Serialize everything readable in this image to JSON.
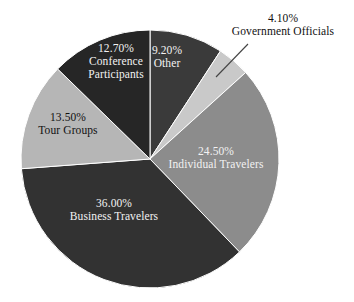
{
  "chart_data": {
    "type": "pie",
    "title": "",
    "subtitle": "",
    "xlabel": "",
    "ylabel": "",
    "legend_position": "none",
    "grid": false,
    "labels_inside": true,
    "categories": [
      "Other",
      "Government Officials",
      "Individual Travelers",
      "Business Travelers",
      "Tour Groups",
      "Conference Participants"
    ],
    "values": [
      9.2,
      4.1,
      24.5,
      36.0,
      13.5,
      12.7
    ],
    "value_labels": [
      "9.20%",
      "4.10%",
      "24.50%",
      "36.00%",
      "13.50%",
      "12.70%"
    ],
    "colors": [
      "#3a3a3a",
      "#c9c9c9",
      "#8c8c8c",
      "#323232",
      "#b6b6b6",
      "#262626"
    ],
    "start_angle_deg": 0,
    "direction": "clockwise",
    "units": "percent",
    "total": 100.0,
    "slices": [
      {
        "name": "Other",
        "value": 9.2,
        "pct_text": "9.20%",
        "name_text": "Other",
        "color": "#3a3a3a",
        "label_color": "#f2f2f2",
        "label_placement": "inside"
      },
      {
        "name": "Government Officials",
        "value": 4.1,
        "pct_text": "4.10%",
        "name_text": "Government Officials",
        "color": "#c9c9c9",
        "label_color": "#111111",
        "label_placement": "outside-with-leader"
      },
      {
        "name": "Individual Travelers",
        "value": 24.5,
        "pct_text": "24.50%",
        "name_text": "Individual Travelers",
        "color": "#8c8c8c",
        "label_color": "#f2f2f2",
        "label_placement": "inside"
      },
      {
        "name": "Business Travelers",
        "value": 36.0,
        "pct_text": "36.00%",
        "name_text": "Business Travelers",
        "color": "#323232",
        "label_color": "#f2f2f2",
        "label_placement": "inside"
      },
      {
        "name": "Tour Groups",
        "value": 13.5,
        "pct_text": "13.50%",
        "name_text": "Tour Groups",
        "color": "#b6b6b6",
        "label_color": "#111111",
        "label_placement": "inside"
      },
      {
        "name": "Conference Participants",
        "value": 12.7,
        "pct_text": "12.70%",
        "name_text": "Conference Participants",
        "name_line1": "Conference",
        "name_line2": "Participants",
        "color": "#262626",
        "label_color": "#f2f2f2",
        "label_placement": "inside"
      }
    ],
    "geometry": {
      "center_x": 150,
      "center_y": 159,
      "radius": 129
    },
    "background": "#ffffff",
    "leader_line": {
      "from_x": 216,
      "from_y": 77,
      "to_x": 248,
      "to_y": 44,
      "color": "#444444"
    }
  }
}
